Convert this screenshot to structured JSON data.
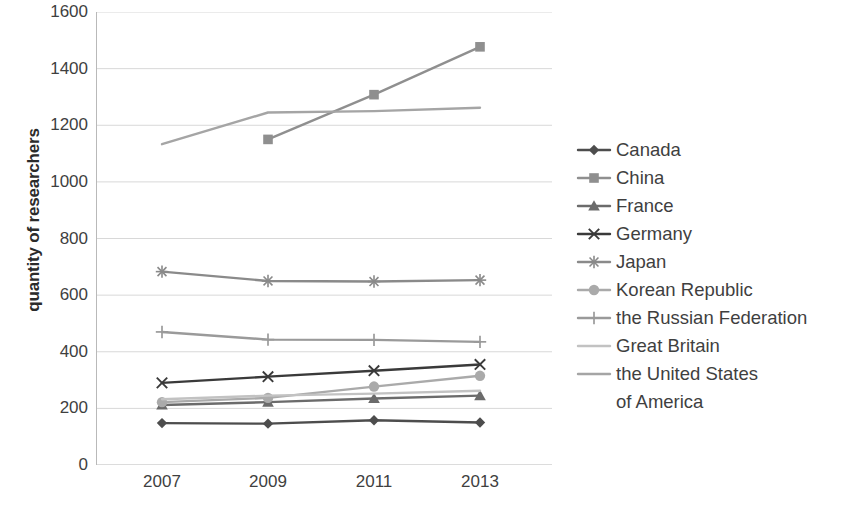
{
  "chart_data": {
    "type": "line",
    "title": "",
    "xlabel": "",
    "ylabel": "quantity of researchers",
    "x": [
      2007,
      2009,
      2011,
      2013
    ],
    "xtick_labels": [
      "2007",
      "2009",
      "2011",
      "2013"
    ],
    "ylim": [
      0,
      1600
    ],
    "ytick_labels": [
      "0",
      "200",
      "400",
      "600",
      "800",
      "1000",
      "1200",
      "1400",
      "1600"
    ],
    "yticks": [
      0,
      200,
      400,
      600,
      800,
      1000,
      1200,
      1400,
      1600
    ],
    "grid": true,
    "legend_position": "right",
    "series": [
      {
        "name": "Canada",
        "values": [
          148,
          146,
          158,
          150
        ],
        "color": "#4d4d4d",
        "marker": "diamond"
      },
      {
        "name": "China",
        "values": [
          null,
          1150,
          1308,
          1477
        ],
        "color": "#8f8f8f",
        "marker": "square"
      },
      {
        "name": "France",
        "values": [
          212,
          222,
          235,
          245
        ],
        "color": "#6b6b6b",
        "marker": "triangle"
      },
      {
        "name": "Germany",
        "values": [
          290,
          312,
          333,
          355
        ],
        "color": "#3a3a3a",
        "marker": "cross-x"
      },
      {
        "name": "Japan",
        "values": [
          683,
          650,
          648,
          653
        ],
        "color": "#8a8a8a",
        "marker": "asterisk"
      },
      {
        "name": "Korean Republic",
        "values": [
          222,
          237,
          277,
          315
        ],
        "color": "#aaaaaa",
        "marker": "circle"
      },
      {
        "name": "the Russian Federation",
        "values": [
          470,
          443,
          442,
          435
        ],
        "color": "#9a9a9a",
        "marker": "plus"
      },
      {
        "name": "Great Britain",
        "values": [
          232,
          245,
          252,
          262
        ],
        "color": "#c2c2c2",
        "marker": "line"
      },
      {
        "name": "the United States of America",
        "values": [
          1133,
          1245,
          1250,
          1262
        ],
        "color": "#a5a5a5",
        "marker": "line"
      }
    ]
  },
  "legend": {
    "entries": [
      {
        "label": "Canada"
      },
      {
        "label": "China"
      },
      {
        "label": "France"
      },
      {
        "label": "Germany"
      },
      {
        "label": "Japan"
      },
      {
        "label": "Korean Republic"
      },
      {
        "label": "the Russian Federation"
      },
      {
        "label": "Great Britain"
      },
      {
        "label": "the United States"
      }
    ],
    "continuation_line": "of America"
  },
  "axis": {
    "y_title": "quantity of researchers"
  }
}
